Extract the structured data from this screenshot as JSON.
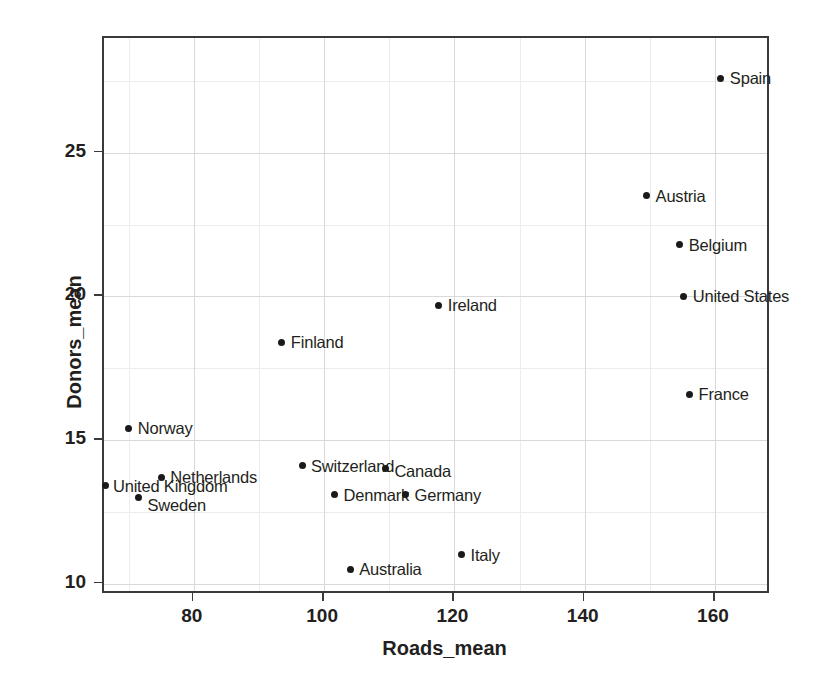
{
  "chart_data": {
    "type": "scatter",
    "title": "",
    "xlabel": "Roads_mean",
    "ylabel": "Donors_mean",
    "xlim": [
      66.2,
      168.6
    ],
    "ylim": [
      9.6,
      29.0
    ],
    "xticks": [
      80,
      100,
      120,
      140,
      160
    ],
    "xticklabels": [
      "80",
      "100",
      "120",
      "140",
      "160"
    ],
    "yticks": [
      10,
      15,
      20,
      25
    ],
    "yticklabels": [
      "10",
      "15",
      "20",
      "25"
    ],
    "grid": true,
    "grid_minor": true,
    "legend": "none",
    "marker_color": "#1a1a1a",
    "grid_color": "#d9d9dc",
    "axis_color": "#3a3a3c",
    "points": [
      {
        "label": "Spain",
        "x": 160.9,
        "y": 27.6
      },
      {
        "label": "Austria",
        "x": 149.5,
        "y": 23.5
      },
      {
        "label": "Belgium",
        "x": 154.6,
        "y": 21.8
      },
      {
        "label": "United States",
        "x": 155.2,
        "y": 20.0
      },
      {
        "label": "Ireland",
        "x": 117.6,
        "y": 19.7
      },
      {
        "label": "Finland",
        "x": 93.5,
        "y": 18.4
      },
      {
        "label": "France",
        "x": 156.1,
        "y": 16.6
      },
      {
        "label": "Norway",
        "x": 70.0,
        "y": 15.4
      },
      {
        "label": "Switzerland",
        "x": 96.6,
        "y": 14.1
      },
      {
        "label": "Canada",
        "x": 109.4,
        "y": 14.0
      },
      {
        "label": "Netherlands",
        "x": 75.0,
        "y": 13.7
      },
      {
        "label": "United Kingdom",
        "x": 66.5,
        "y": 13.4
      },
      {
        "label": "Denmark",
        "x": 101.6,
        "y": 13.1
      },
      {
        "label": "Germany",
        "x": 112.5,
        "y": 13.1
      },
      {
        "label": "Sweden",
        "x": 71.5,
        "y": 13.0
      },
      {
        "label": "Italy",
        "x": 121.1,
        "y": 11.0
      },
      {
        "label": "Australia",
        "x": 104.0,
        "y": 10.5
      }
    ],
    "label_offsets": [
      {
        "label": "Spain",
        "dx": 9,
        "dy": 0
      },
      {
        "label": "Austria",
        "dx": 9,
        "dy": 0
      },
      {
        "label": "Belgium",
        "dx": 9,
        "dy": 0
      },
      {
        "label": "United States",
        "dx": 9,
        "dy": 0
      },
      {
        "label": "Ireland",
        "dx": 9,
        "dy": 0
      },
      {
        "label": "Finland",
        "dx": 9,
        "dy": 0
      },
      {
        "label": "France",
        "dx": 9,
        "dy": 0
      },
      {
        "label": "Norway",
        "dx": 9,
        "dy": 0
      },
      {
        "label": "Switzerland",
        "dx": 9,
        "dy": 0
      },
      {
        "label": "Canada",
        "dx": 9,
        "dy": 2
      },
      {
        "label": "Netherlands",
        "dx": 9,
        "dy": 0
      },
      {
        "label": "United Kingdom",
        "dx": 7,
        "dy": 0
      },
      {
        "label": "Denmark",
        "dx": 9,
        "dy": 0
      },
      {
        "label": "Germany",
        "dx": 9,
        "dy": 0
      },
      {
        "label": "Sweden",
        "dx": 9,
        "dy": 8
      },
      {
        "label": "Italy",
        "dx": 9,
        "dy": 0
      },
      {
        "label": "Australia",
        "dx": 9,
        "dy": 0
      }
    ]
  }
}
